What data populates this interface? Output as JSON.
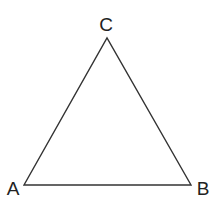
{
  "diagram": {
    "type": "triangle",
    "stroke_color": "#333333",
    "vertices": [
      {
        "label": "A",
        "x": 24,
        "y": 185,
        "label_x": 13,
        "label_y": 195
      },
      {
        "label": "B",
        "x": 191,
        "y": 185,
        "label_x": 203,
        "label_y": 195
      },
      {
        "label": "C",
        "x": 107,
        "y": 38,
        "label_x": 106,
        "label_y": 31
      }
    ]
  }
}
